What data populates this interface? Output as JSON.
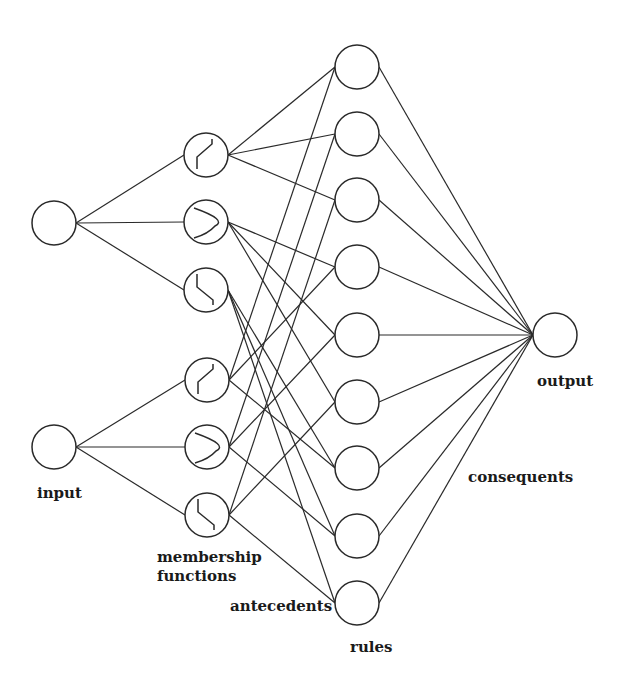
{
  "diagram": {
    "type": "neuro-fuzzy network (ANFIS)",
    "labels": {
      "input": "input",
      "membership": "membership",
      "functions": "functions",
      "antecedents": "antecedents",
      "rules": "rules",
      "consequents": "consequents",
      "output": "output"
    },
    "layers": {
      "inputs": [
        {
          "id": "x1",
          "cx": 54,
          "cy": 223
        },
        {
          "id": "x2",
          "cx": 54,
          "cy": 447
        }
      ],
      "membership_functions": [
        {
          "id": "A1",
          "input": "x1",
          "shape": "rising-ramp",
          "cx": 206,
          "cy": 155
        },
        {
          "id": "A2",
          "input": "x1",
          "shape": "u-bell",
          "cx": 206,
          "cy": 222
        },
        {
          "id": "A3",
          "input": "x1",
          "shape": "falling-ramp",
          "cx": 206,
          "cy": 290
        },
        {
          "id": "B1",
          "input": "x2",
          "shape": "rising-ramp",
          "cx": 207,
          "cy": 380
        },
        {
          "id": "B2",
          "input": "x2",
          "shape": "u-bell",
          "cx": 207,
          "cy": 447
        },
        {
          "id": "B3",
          "input": "x2",
          "shape": "falling-ramp",
          "cx": 207,
          "cy": 515
        }
      ],
      "rules": [
        {
          "id": "R1",
          "cx": 357,
          "cy": 67,
          "antecedents": [
            "A1",
            "B1"
          ]
        },
        {
          "id": "R2",
          "cx": 357,
          "cy": 134,
          "antecedents": [
            "A1",
            "B2"
          ]
        },
        {
          "id": "R3",
          "cx": 357,
          "cy": 200,
          "antecedents": [
            "A1",
            "B3"
          ]
        },
        {
          "id": "R4",
          "cx": 357,
          "cy": 267,
          "antecedents": [
            "A2",
            "B1"
          ]
        },
        {
          "id": "R5",
          "cx": 357,
          "cy": 335,
          "antecedents": [
            "A2",
            "B2"
          ]
        },
        {
          "id": "R6",
          "cx": 357,
          "cy": 402,
          "antecedents": [
            "A2",
            "B3"
          ]
        },
        {
          "id": "R7",
          "cx": 357,
          "cy": 468,
          "antecedents": [
            "A3",
            "B1"
          ]
        },
        {
          "id": "R8",
          "cx": 357,
          "cy": 536,
          "antecedents": [
            "A3",
            "B2"
          ]
        },
        {
          "id": "R9",
          "cx": 357,
          "cy": 603,
          "antecedents": [
            "A3",
            "B3"
          ]
        }
      ],
      "output": {
        "id": "y",
        "cx": 555,
        "cy": 335
      }
    },
    "node_radius": 22,
    "stroke_color": "#2a2a2a",
    "background": "#ffffff"
  }
}
